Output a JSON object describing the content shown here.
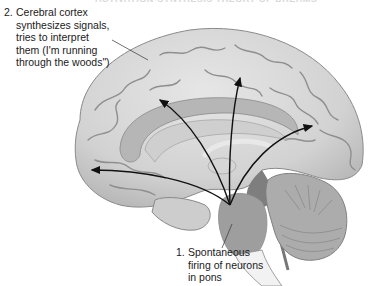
{
  "figure": {
    "heading": "ACTIVATION-SYNTHESIS THEORY OF DREAMS",
    "labels": {
      "cortex": {
        "number": "2.",
        "lines": [
          "Cerebral cortex",
          "synthesizes signals,",
          "tries to interpret",
          "them (I'm running",
          "through the woods\")"
        ]
      },
      "pons": {
        "number": "1.",
        "lines": [
          "Spontaneous",
          "firing of neurons",
          "in pons"
        ]
      }
    },
    "structures": [
      "cerebral-cortex",
      "corpus-callosum",
      "thalamus",
      "pons",
      "cerebellum",
      "brainstem"
    ],
    "colors": {
      "cortex": "#d9d9d9",
      "cortex_shadow": "#9a9a9a",
      "inner_band": "#b4b4b4",
      "pons": "#9e9e9e",
      "cerebellum": "#a8a8a8",
      "arrow": "#111111",
      "text": "#1a1a1a"
    }
  }
}
